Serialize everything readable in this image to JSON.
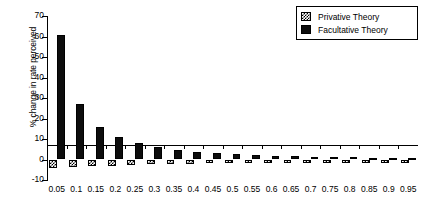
{
  "chart_data": {
    "type": "bar",
    "title": "",
    "subtitle": "",
    "xlabel": "",
    "ylabel": "% change in rate perceived",
    "ylim": [
      -10,
      70
    ],
    "yticks": [
      -10,
      0,
      10,
      20,
      30,
      40,
      50,
      60,
      70
    ],
    "ytick_labels": [
      "-10",
      "0",
      "10",
      "20",
      "30",
      "40",
      "50",
      "60",
      "70"
    ],
    "grid": false,
    "legend_position": "top-right",
    "categories": [
      "0.05",
      "0.1",
      "0.15",
      "0.2",
      "0.25",
      "0.3",
      "0.35",
      "0.4",
      "0.45",
      "0.5",
      "0.55",
      "0.6",
      "0.65",
      "0.7",
      "0.75",
      "0.8",
      "0.85",
      "0.9",
      "0.95"
    ],
    "series": [
      {
        "name": "Privative Theory",
        "pattern": "hatched",
        "color": "#000000",
        "values": [
          -4.0,
          -3.6,
          -3.3,
          -3.0,
          -2.7,
          -2.4,
          -2.2,
          -2.0,
          -1.8,
          -1.6,
          -1.4,
          -1.3,
          -1.1,
          -1.0,
          -0.9,
          -0.8,
          -0.7,
          -0.6,
          -0.5
        ]
      },
      {
        "name": "Facultative Theory",
        "pattern": "solid",
        "color": "#0d0d0d",
        "values": [
          60.5,
          27.0,
          16.0,
          11.0,
          8.0,
          6.0,
          4.8,
          3.8,
          3.1,
          2.6,
          2.2,
          1.9,
          1.6,
          1.4,
          1.2,
          1.0,
          0.9,
          0.8,
          0.6
        ]
      }
    ]
  },
  "legend": {
    "items": [
      {
        "label": "Privative Theory",
        "swatch": "hatch"
      },
      {
        "label": "Facultative Theory",
        "swatch": "solid"
      }
    ]
  }
}
